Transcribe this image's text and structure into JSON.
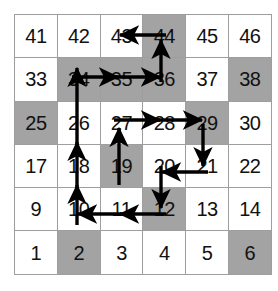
{
  "diagram": {
    "grid": {
      "columns": 6,
      "rows": 6,
      "cell_numbering": "row-major from bottom-left, increasing left to right then upward",
      "shaded_color": "#a3a3a3",
      "cell_color": "#ffffff",
      "border_color": "#9e9e9e",
      "text_color": "#111111",
      "arrow_color": "#000000",
      "rows_top_to_bottom": [
        [
          {
            "label": "41",
            "shaded": false
          },
          {
            "label": "42",
            "shaded": false
          },
          {
            "label": "43",
            "shaded": false
          },
          {
            "label": "44",
            "shaded": true
          },
          {
            "label": "45",
            "shaded": false
          },
          {
            "label": "46",
            "shaded": false
          }
        ],
        [
          {
            "label": "33",
            "shaded": false
          },
          {
            "label": "34",
            "shaded": true
          },
          {
            "label": "35",
            "shaded": true
          },
          {
            "label": "36",
            "shaded": true
          },
          {
            "label": "37",
            "shaded": false
          },
          {
            "label": "38",
            "shaded": true
          }
        ],
        [
          {
            "label": "25",
            "shaded": true
          },
          {
            "label": "26",
            "shaded": false
          },
          {
            "label": "27",
            "shaded": false
          },
          {
            "label": "28",
            "shaded": false
          },
          {
            "label": "29",
            "shaded": true
          },
          {
            "label": "30",
            "shaded": false
          }
        ],
        [
          {
            "label": "17",
            "shaded": false
          },
          {
            "label": "18",
            "shaded": false
          },
          {
            "label": "19",
            "shaded": true
          },
          {
            "label": "20",
            "shaded": false
          },
          {
            "label": "21",
            "shaded": false
          },
          {
            "label": "22",
            "shaded": false
          }
        ],
        [
          {
            "label": "9",
            "shaded": false
          },
          {
            "label": "10",
            "shaded": false
          },
          {
            "label": "11",
            "shaded": false
          },
          {
            "label": "12",
            "shaded": true
          },
          {
            "label": "13",
            "shaded": false
          },
          {
            "label": "14",
            "shaded": false
          }
        ],
        [
          {
            "label": "1",
            "shaded": false
          },
          {
            "label": "2",
            "shaded": true
          },
          {
            "label": "3",
            "shaded": false
          },
          {
            "label": "4",
            "shaded": false
          },
          {
            "label": "5",
            "shaded": false
          },
          {
            "label": "6",
            "shaded": true
          }
        ]
      ]
    },
    "path_segments": [
      {
        "from": "10",
        "to": "18",
        "direction": "up"
      },
      {
        "from": "18",
        "to": "26",
        "direction": "up"
      },
      {
        "from": "26",
        "to": "34",
        "direction": "up"
      },
      {
        "from": "34",
        "to": "35",
        "direction": "right"
      },
      {
        "from": "35",
        "to": "36",
        "direction": "right"
      },
      {
        "from": "36",
        "to": "44",
        "direction": "up"
      },
      {
        "from": "44",
        "to": "43",
        "direction": "left"
      },
      {
        "from": "19",
        "to": "27",
        "direction": "up"
      },
      {
        "from": "27",
        "to": "28",
        "direction": "right"
      },
      {
        "from": "28",
        "to": "29",
        "direction": "right"
      },
      {
        "from": "29",
        "to": "21",
        "direction": "down"
      },
      {
        "from": "21",
        "to": "20",
        "direction": "left"
      },
      {
        "from": "20",
        "to": "12",
        "direction": "down"
      },
      {
        "from": "12",
        "to": "11",
        "direction": "left"
      },
      {
        "from": "11",
        "to": "10",
        "direction": "left"
      }
    ]
  }
}
